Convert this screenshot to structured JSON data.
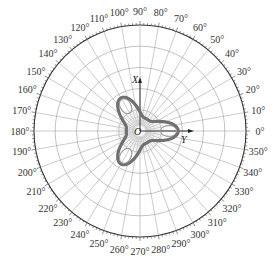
{
  "chart_data": {
    "type": "polar",
    "title": "",
    "angle_unit": "degree",
    "angle_ticks": [
      0,
      10,
      20,
      30,
      40,
      50,
      60,
      70,
      80,
      90,
      100,
      110,
      120,
      130,
      140,
      150,
      160,
      170,
      180,
      190,
      200,
      210,
      220,
      230,
      240,
      250,
      260,
      270,
      280,
      290,
      300,
      310,
      320,
      330,
      340,
      350
    ],
    "angle_tick_labels": [
      "0°",
      "10°",
      "20°",
      "30°",
      "40°",
      "50°",
      "60°",
      "70°",
      "80°",
      "90°",
      "100°",
      "110°",
      "120°",
      "130°",
      "140°",
      "150°",
      "160°",
      "170°",
      "180°",
      "190°",
      "200°",
      "210°",
      "220°",
      "230°",
      "240°",
      "250°",
      "260°",
      "270°",
      "280°",
      "290°",
      "300°",
      "310°",
      "320°",
      "330°",
      "340°",
      "350°"
    ],
    "radial_rings": 5,
    "radial_range": [
      0,
      1
    ],
    "grid": true,
    "axes": {
      "x_axis_label": "X",
      "y_axis_label": "Y",
      "origin_label": "O"
    },
    "series": [
      {
        "name": "three-lobed pattern",
        "color": "#707070",
        "shape": "trefoil",
        "lobe_directions_deg": [
          0,
          120,
          240
        ],
        "lobe_peak_radius": 0.36,
        "lobe_min_radius": 0.13,
        "theta_deg": [
          0,
          15,
          30,
          45,
          60,
          75,
          90,
          105,
          120,
          135,
          150,
          165,
          180,
          195,
          210,
          225,
          240,
          255,
          270,
          285,
          300,
          315,
          330,
          345,
          360
        ],
        "r": [
          0.36,
          0.3,
          0.17,
          0.13,
          0.17,
          0.3,
          0.36,
          0.3,
          0.36,
          0.3,
          0.17,
          0.13,
          0.17,
          0.3,
          0.36,
          0.3,
          0.36,
          0.3,
          0.17,
          0.13,
          0.17,
          0.3,
          0.36,
          0.3,
          0.36
        ]
      }
    ]
  }
}
